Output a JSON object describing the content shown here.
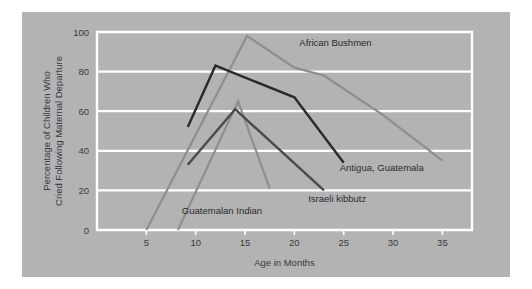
{
  "figure": {
    "background_color": "#b3b3b3",
    "page_background_color": "#ffffff",
    "frame_color": "#ffffff",
    "grid_color": "#ffffff",
    "text_color": "#3a3a3a"
  },
  "chart_data": {
    "type": "line",
    "title": "",
    "subtitle": "",
    "xlabel": "Age in Months",
    "ylabel": "Percentage of Children Who Cried Following Maternal Departure",
    "ylabel_line1": "Percentage of Children Who",
    "ylabel_line2": "Cried Following Maternal Departure",
    "xlim": [
      0,
      38
    ],
    "ylim": [
      0,
      100
    ],
    "xticks": [
      5,
      10,
      15,
      20,
      25,
      30,
      35
    ],
    "xtick_labels": [
      "5",
      "10",
      "15",
      "20",
      "25",
      "30",
      "35"
    ],
    "yticks": [
      0,
      20,
      40,
      60,
      80,
      100
    ],
    "ytick_labels": [
      "0",
      "20",
      "40",
      "60",
      "80",
      "100"
    ],
    "grid": true,
    "grid_axis": "y",
    "legend": "inline-annotations",
    "series": [
      {
        "name": "African Bushmen",
        "color": "#8e8e8e",
        "width": 2.2,
        "label_x": 20.5,
        "label_y": 93,
        "points": [
          {
            "x": 5.0,
            "y": 0
          },
          {
            "x": 15.2,
            "y": 98
          },
          {
            "x": 20.0,
            "y": 82
          },
          {
            "x": 23.0,
            "y": 78
          },
          {
            "x": 29.0,
            "y": 58
          },
          {
            "x": 35.0,
            "y": 35
          }
        ]
      },
      {
        "name": "Guatemalan Indian",
        "color": "#8e8e8e",
        "width": 2.2,
        "label_x": 8.6,
        "label_y": 8,
        "points": [
          {
            "x": 8.2,
            "y": 0
          },
          {
            "x": 14.3,
            "y": 65
          },
          {
            "x": 17.5,
            "y": 21
          }
        ]
      },
      {
        "name": "Antigua, Guatemala",
        "color": "#2b2b2b",
        "width": 2.4,
        "label_x": 24.6,
        "label_y": 30,
        "points": [
          {
            "x": 9.2,
            "y": 52
          },
          {
            "x": 12.0,
            "y": 83
          },
          {
            "x": 20.0,
            "y": 67
          },
          {
            "x": 25.0,
            "y": 34
          }
        ]
      },
      {
        "name": "Israeli kibbutz",
        "color": "#4a4a4a",
        "width": 2.4,
        "label_x": 21.4,
        "label_y": 14,
        "points": [
          {
            "x": 9.2,
            "y": 33
          },
          {
            "x": 14.0,
            "y": 61
          },
          {
            "x": 23.0,
            "y": 20
          }
        ]
      }
    ]
  }
}
